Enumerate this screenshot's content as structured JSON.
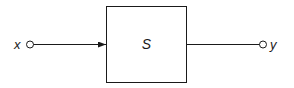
{
  "diagram": {
    "type": "block-diagram",
    "input_label": "x",
    "output_label": "y",
    "system_label": "S",
    "stroke_color": "#1a1a1a",
    "background": "#ffffff"
  }
}
